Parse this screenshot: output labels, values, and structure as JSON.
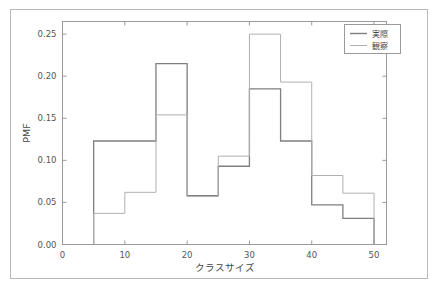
{
  "chart_data": {
    "type": "line",
    "subtype": "step-histogram",
    "title": "",
    "xlabel": "クラスサイズ",
    "ylabel": "PMF",
    "xlim": [
      0,
      52
    ],
    "ylim": [
      0.0,
      0.265
    ],
    "xticks": [
      0,
      10,
      20,
      30,
      40,
      50
    ],
    "xtick_labels": [
      "0",
      "10",
      "20",
      "30",
      "40",
      "50"
    ],
    "yticks": [
      0.0,
      0.05,
      0.1,
      0.15,
      0.2,
      0.25
    ],
    "ytick_labels": [
      "0.00",
      "0.05",
      "0.10",
      "0.15",
      "0.20",
      "0.25"
    ],
    "grid": false,
    "legend_position": "upper right",
    "bin_edges": [
      5,
      10,
      15,
      20,
      25,
      30,
      35,
      40,
      45,
      50
    ],
    "series": [
      {
        "name": "実際",
        "color": "#7f7f7f",
        "values": [
          0.123,
          0.123,
          0.215,
          0.058,
          0.093,
          0.185,
          0.123,
          0.047,
          0.031
        ]
      },
      {
        "name": "観察",
        "color": "#b0b0b0",
        "values": [
          0.037,
          0.062,
          0.154,
          0.057,
          0.105,
          0.25,
          0.193,
          0.082,
          0.061
        ]
      }
    ]
  },
  "legend": {
    "entries": [
      {
        "label": "実際"
      },
      {
        "label": "観察"
      }
    ]
  },
  "axes": {
    "x_title": "クラスサイズ",
    "y_title": "PMF"
  }
}
